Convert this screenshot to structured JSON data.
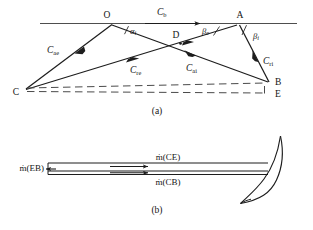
{
  "figure": {
    "panels": [
      {
        "id": "a",
        "caption": "(a)",
        "points": [
          {
            "name": "O",
            "label": "O",
            "x": 110,
            "y": 22
          },
          {
            "name": "A",
            "label": "A",
            "x": 238,
            "y": 22
          },
          {
            "name": "B",
            "label": "B",
            "x": 270,
            "y": 82
          },
          {
            "name": "C",
            "label": "C",
            "x": 22,
            "y": 90
          },
          {
            "name": "D",
            "label": "D",
            "x": 178,
            "y": 42
          },
          {
            "name": "E",
            "label": "E",
            "x": 270,
            "y": 94
          }
        ],
        "vectors": [
          {
            "name": "blade-speed",
            "label": "C",
            "sub": "b",
            "sub_style": "roman"
          },
          {
            "name": "absolute-exit",
            "label": "C",
            "sub": "ae",
            "sub_style": "roman"
          },
          {
            "name": "relative-exit",
            "label": "C",
            "sub": "re",
            "sub_style": "roman"
          },
          {
            "name": "absolute-inlet",
            "label": "C",
            "sub": "ai",
            "sub_style": "roman"
          },
          {
            "name": "relative-inlet",
            "label": "C",
            "sub": "ri",
            "sub_style": "roman"
          }
        ],
        "angles": [
          {
            "name": "alpha-i",
            "label": "α",
            "sub": "i"
          },
          {
            "name": "beta-e",
            "label": "β",
            "sub": "e"
          },
          {
            "name": "beta-i",
            "label": "β",
            "sub": "i"
          }
        ]
      },
      {
        "id": "b",
        "caption": "(b)",
        "flows": [
          {
            "name": "mdot-eb",
            "label": "ṁ(EB)"
          },
          {
            "name": "mdot-ce",
            "label": "ṁ(CE)"
          },
          {
            "name": "mdot-cb",
            "label": "ṁ(CB)"
          }
        ],
        "blade": {
          "name": "blade-profile"
        }
      }
    ],
    "colors": {
      "ink": "#141414",
      "line": "#2b2b2b",
      "background": "#ffffff"
    }
  }
}
